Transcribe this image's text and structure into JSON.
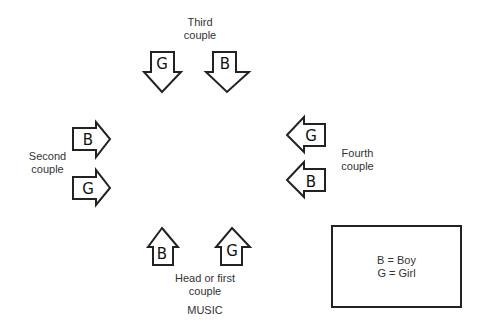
{
  "diagram": {
    "couples": {
      "third": {
        "label_line1": "Third",
        "label_line2": "couple",
        "dancers": [
          "G",
          "B"
        ],
        "facing": "down"
      },
      "second": {
        "label_line1": "Second",
        "label_line2": "couple",
        "dancers": [
          "B",
          "G"
        ],
        "facing": "right"
      },
      "fourth": {
        "label_line1": "Fourth",
        "label_line2": "couple",
        "dancers": [
          "G",
          "B"
        ],
        "facing": "left"
      },
      "head": {
        "label_line1": "Head or first",
        "label_line2": "couple",
        "dancers": [
          "B",
          "G"
        ],
        "facing": "up"
      }
    },
    "music_label": "MUSIC",
    "legend": {
      "line1": "B = Boy",
      "line2": "G = Girl"
    },
    "colors": {
      "stroke": "#222222",
      "background": "#ffffff"
    }
  }
}
